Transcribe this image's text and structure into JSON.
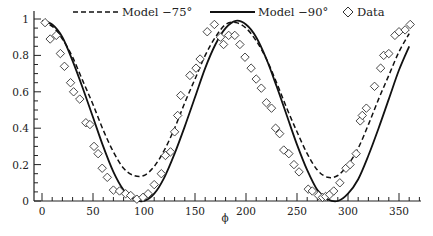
{
  "chart_data": {
    "type": "line",
    "title": "",
    "xlabel": "ϕ",
    "ylabel": "",
    "xlim": [
      0,
      370
    ],
    "ylim": [
      0,
      1.03
    ],
    "grid": false,
    "legend_position": "top",
    "x_ticks": [
      0,
      50,
      100,
      150,
      200,
      250,
      300,
      350
    ],
    "x_tick_labels": [
      "0",
      "50",
      "100",
      "150",
      "200",
      "250",
      "300",
      "350"
    ],
    "y_ticks": [
      0,
      0.2,
      0.4,
      0.6,
      0.8,
      1
    ],
    "y_tick_labels": [
      "0",
      "0.2",
      "0.4",
      "0.6",
      "0.8",
      "1"
    ],
    "legend": [
      {
        "name": "Model −75°",
        "style": "dashed"
      },
      {
        "name": "Model −90°",
        "style": "solid"
      },
      {
        "name": "Data",
        "style": "diamond-marker"
      }
    ],
    "series": [
      {
        "name": "Model −75°",
        "style": "dashed",
        "x": [
          0,
          10,
          20,
          30,
          40,
          50,
          60,
          70,
          80,
          90,
          100,
          110,
          120,
          130,
          140,
          150,
          160,
          170,
          180,
          190,
          200,
          210,
          220,
          230,
          240,
          250,
          260,
          270,
          280,
          290,
          300,
          310,
          320,
          330,
          340,
          350,
          360
        ],
        "y": [
          0.98,
          0.96,
          0.89,
          0.79,
          0.66,
          0.53,
          0.39,
          0.27,
          0.18,
          0.14,
          0.14,
          0.19,
          0.28,
          0.4,
          0.54,
          0.67,
          0.8,
          0.9,
          0.97,
          0.98,
          0.95,
          0.88,
          0.78,
          0.65,
          0.51,
          0.38,
          0.26,
          0.17,
          0.13,
          0.14,
          0.2,
          0.29,
          0.42,
          0.56,
          0.69,
          0.82,
          0.92
        ]
      },
      {
        "name": "Model −90°",
        "style": "solid",
        "x": [
          0,
          10,
          20,
          30,
          40,
          50,
          60,
          70,
          80,
          90,
          100,
          110,
          120,
          130,
          140,
          150,
          160,
          170,
          180,
          190,
          200,
          210,
          220,
          230,
          240,
          250,
          260,
          270,
          280,
          290,
          300,
          310,
          320,
          330,
          340,
          350,
          360
        ],
        "y": [
          0.99,
          0.97,
          0.9,
          0.77,
          0.62,
          0.46,
          0.3,
          0.16,
          0.06,
          0.01,
          0.0,
          0.04,
          0.13,
          0.26,
          0.41,
          0.57,
          0.73,
          0.86,
          0.95,
          0.99,
          0.97,
          0.9,
          0.78,
          0.63,
          0.47,
          0.31,
          0.17,
          0.06,
          0.01,
          0.0,
          0.04,
          0.12,
          0.25,
          0.4,
          0.56,
          0.72,
          0.85
        ]
      },
      {
        "name": "Data",
        "style": "diamond-marker",
        "x": [
          3,
          8,
          14,
          18,
          22,
          28,
          31,
          37,
          43,
          47,
          51,
          55,
          59,
          64,
          70,
          76,
          82,
          87,
          93,
          99,
          104,
          110,
          117,
          121,
          126,
          130,
          133,
          136,
          145,
          151,
          155,
          162,
          169,
          175,
          178,
          183,
          189,
          194,
          199,
          205,
          210,
          215,
          220,
          225,
          229,
          233,
          237,
          242,
          247,
          252,
          261,
          265,
          271,
          275,
          278,
          282,
          286,
          292,
          298,
          302,
          308,
          312,
          314,
          318,
          326,
          332,
          335,
          340,
          346,
          350,
          356,
          361
        ],
        "y": [
          0.98,
          0.89,
          0.91,
          0.81,
          0.74,
          0.65,
          0.6,
          0.56,
          0.43,
          0.42,
          0.3,
          0.26,
          0.18,
          0.13,
          0.06,
          0.055,
          0.04,
          0.03,
          0.01,
          0.02,
          0.04,
          0.09,
          0.15,
          0.25,
          0.27,
          0.38,
          0.47,
          0.58,
          0.69,
          0.73,
          0.78,
          0.93,
          0.97,
          0.9,
          0.86,
          0.91,
          0.91,
          0.86,
          0.79,
          0.73,
          0.67,
          0.62,
          0.54,
          0.51,
          0.4,
          0.37,
          0.28,
          0.26,
          0.2,
          0.16,
          0.065,
          0.055,
          0.03,
          0.02,
          0.025,
          0.035,
          0.055,
          0.1,
          0.18,
          0.2,
          0.26,
          0.44,
          0.47,
          0.51,
          0.63,
          0.73,
          0.8,
          0.81,
          0.91,
          0.93,
          0.94,
          0.97
        ]
      }
    ]
  },
  "legend": {
    "dashed_label": "Model −75°",
    "solid_label": "Model −90°",
    "data_label": "Data"
  },
  "axes": {
    "x_title": "ϕ"
  },
  "colors": {
    "ink": "#111111",
    "background": "#ffffff"
  }
}
